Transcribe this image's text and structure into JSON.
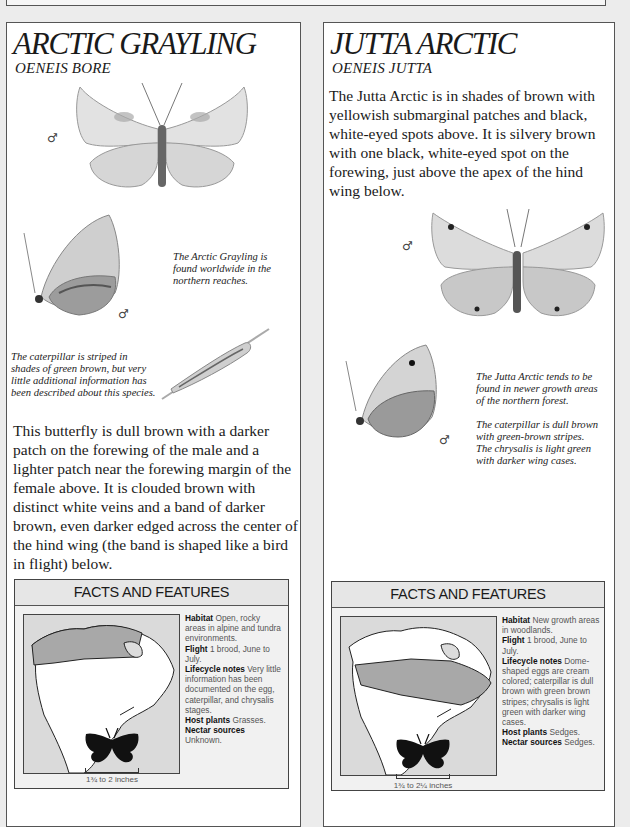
{
  "page": {
    "header_partial_text": ""
  },
  "left": {
    "title": "ARCTIC GRAYLING",
    "latin": "OENEIS BORE",
    "male_symbol": "♂",
    "caption_range": "The Arctic Grayling is found worldwide in the northern reaches.",
    "caption_caterpillar": "The caterpillar is striped in shades of green brown, but very little additional information has been described about this species.",
    "description": "This butterfly is dull brown with a darker patch on the forewing of the male and a lighter patch near the forewing margin of the female above. It is clouded brown with distinct white veins and a band of darker brown, even darker edged across the center of the hind wing (the band is shaped like a bird in flight) below.",
    "facts": {
      "header": "FACTS AND FEATURES",
      "habitat_label": "Habitat",
      "habitat": "Open, rocky areas in alpine and tundra environments.",
      "flight_label": "Flight",
      "flight": "1 brood, June to July.",
      "lifecycle_label": "Lifecycle notes",
      "lifecycle": "Very little information has been documented on the egg, caterpillar, and chrysalis stages.",
      "host_label": "Host plants",
      "host": "Grasses.",
      "nectar_label": "Nectar sources",
      "nectar": "Unknown.",
      "wingspan": "1¾ to 2 inches",
      "map_range": "northern band (Alaska and northern Canada)"
    }
  },
  "right": {
    "title": "JUTTA ARCTIC",
    "latin": "OENEIS JUTTA",
    "male_symbol": "♂",
    "description": "The Jutta Arctic is in shades of brown with yellowish submarginal patches and black, white-eyed spots above. It is silvery brown with one black, white-eyed spot on the forewing, just above the apex of the hind wing below.",
    "caption_range": "The Jutta Arctic tends to be found in newer growth areas of the northern forest.",
    "caption_caterpillar": "The caterpillar is dull brown with green-brown stripes. The chrysalis is light green with darker wing cases.",
    "facts": {
      "header": "FACTS AND FEATURES",
      "habitat_label": "Habitat",
      "habitat": "New growth areas in woodlands.",
      "flight_label": "Flight",
      "flight": "1 brood, June to July.",
      "lifecycle_label": "Lifecycle notes",
      "lifecycle": "Dome-shaped eggs are cream colored; caterpillar is dull brown with green brown stripes; chrysalis is light green with darker wing cases.",
      "host_label": "Host plants",
      "host": "Sedges.",
      "nectar_label": "Nectar sources",
      "nectar": "Sedges.",
      "wingspan": "1¾ to 2¼ inches",
      "map_range": "boreal band across Canada"
    }
  }
}
